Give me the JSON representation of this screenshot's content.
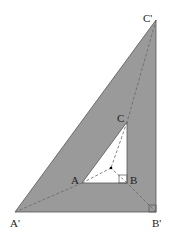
{
  "diagram": {
    "colors": {
      "fill": "#9a9a9a",
      "inner": "#ffffff",
      "stroke": "#555555",
      "dash": "#666666"
    },
    "outer": {
      "A1": [
        15,
        212
      ],
      "B1": [
        156,
        212
      ],
      "C1": [
        156,
        20
      ]
    },
    "inner": {
      "A": [
        82,
        183
      ],
      "B": [
        127,
        183
      ],
      "C": [
        127,
        122
      ]
    },
    "center": [
      111,
      168
    ],
    "labels": {
      "A_prime": "A'",
      "B_prime": "B'",
      "C_prime": "C'",
      "A": "A",
      "B": "B",
      "C": "C"
    }
  }
}
